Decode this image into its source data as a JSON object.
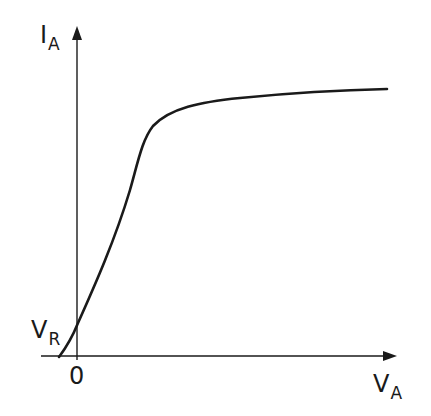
{
  "diagram": {
    "type": "line",
    "axes": {
      "y_label_main": "I",
      "y_label_sub": "A",
      "x_label_main": "V",
      "x_label_sub": "A",
      "origin_label": "0",
      "intercept_label_main": "V",
      "intercept_label_sub": "R"
    },
    "curve_description": "Characteristic curve: starts slightly left of origin on V axis, crosses I axis at V_R, rises steeply then saturates to a nearly flat plateau",
    "colors": {
      "stroke": "#1a1a1a",
      "background": "#ffffff"
    }
  }
}
